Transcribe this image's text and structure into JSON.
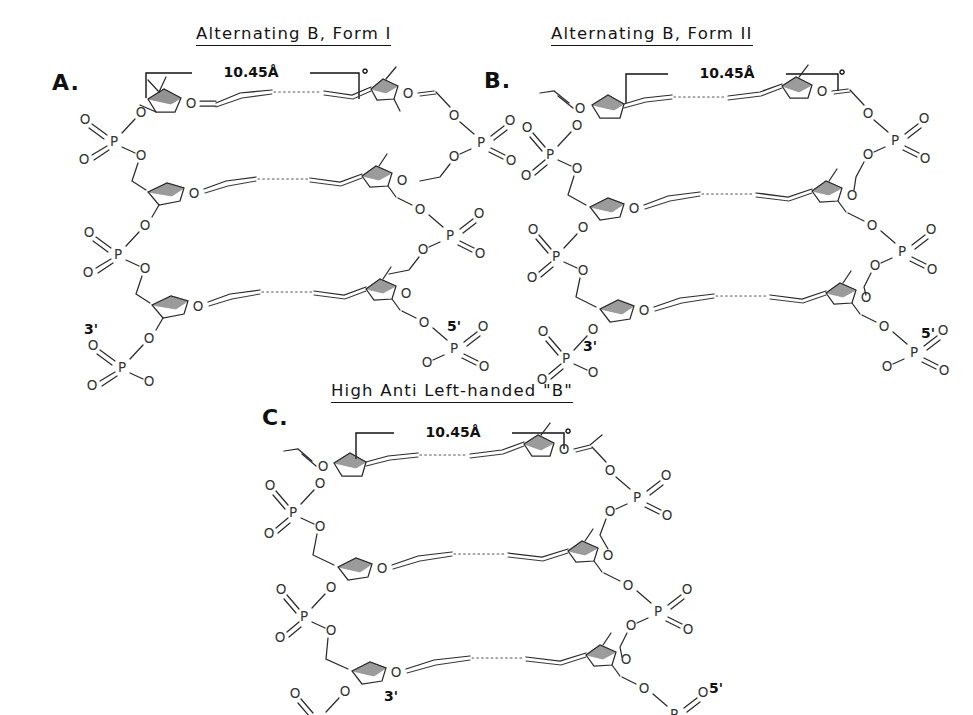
{
  "figure": {
    "dimension_label": "10.45Å",
    "terminus_3": "3'",
    "terminus_5": "5'",
    "atoms": {
      "phosphorus": "P",
      "oxygen": "O"
    }
  },
  "panels": [
    {
      "letter": "A.",
      "title": "Alternating B, Form I",
      "dimension": "10.45Å",
      "left_terminus": "3'",
      "right_terminus": "5'"
    },
    {
      "letter": "B.",
      "title": "Alternating B, Form II",
      "dimension": "10.45Å",
      "left_terminus": "3'",
      "right_terminus": "5'"
    },
    {
      "letter": "C.",
      "title": "High Anti Left-handed \"B\"",
      "dimension": "10.45Å",
      "left_terminus": "3'",
      "right_terminus": "5'"
    }
  ],
  "colors": {
    "ink": "#141414",
    "bond": "#2b2b2b",
    "atom_label": "#333333",
    "hydrogen_bond": "#555555",
    "background": "#ffffff"
  }
}
